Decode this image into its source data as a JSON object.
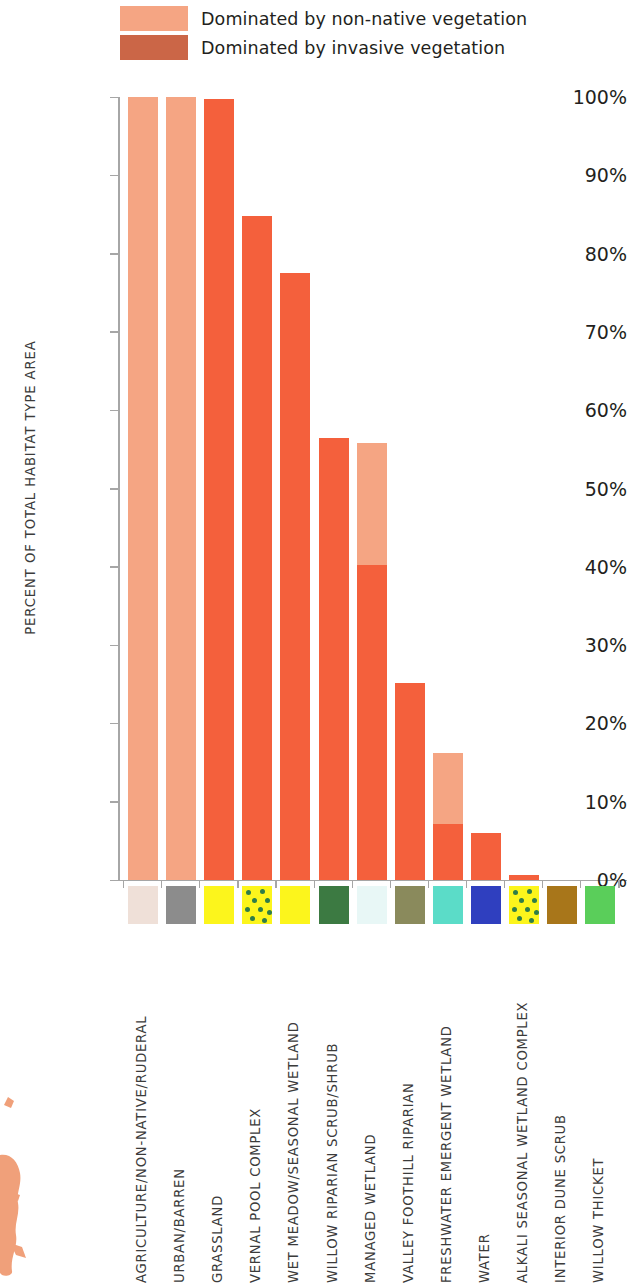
{
  "legend": {
    "items": [
      {
        "label": "Dominated by non-native vegetation",
        "color": "#f5a583",
        "key": "nonnative"
      },
      {
        "label": "Dominated by invasive vegetation",
        "color": "#cb6647",
        "key": "invasive"
      }
    ]
  },
  "axis": {
    "y_label": "PERCENT OF TOTAL HABITAT TYPE AREA",
    "y_ticks": [
      "0%",
      "10%",
      "20%",
      "30%",
      "40%",
      "50%",
      "60%",
      "70%",
      "80%",
      "90%",
      "100%"
    ]
  },
  "chart_data": {
    "type": "bar",
    "title": "",
    "xlabel": "",
    "ylabel": "PERCENT OF TOTAL HABITAT TYPE AREA",
    "ylim": [
      0,
      100
    ],
    "grid": false,
    "legend_position": "top",
    "stacked": true,
    "categories": [
      "AGRICULTURE/NON-NATIVE/RUDERAL",
      "URBAN/BARREN",
      "GRASSLAND",
      "VERNAL POOL COMPLEX",
      "WET MEADOW/SEASONAL WETLAND",
      "WILLOW RIPARIAN SCRUB/SHRUB",
      "MANAGED WETLAND",
      "VALLEY FOOTHILL RIPARIAN",
      "FRESHWATER EMERGENT WETLAND",
      "WATER",
      "ALKALI SEASONAL WETLAND COMPLEX",
      "INTERIOR DUNE SCRUB",
      "WILLOW THICKET"
    ],
    "series": [
      {
        "name": "Dominated by invasive vegetation",
        "color": "#f4603c",
        "values": [
          0,
          0,
          99.7,
          84.8,
          77.5,
          56.5,
          40.2,
          25.1,
          7.1,
          6.0,
          0.6,
          0,
          0
        ]
      },
      {
        "name": "Dominated by non-native vegetation",
        "color": "#f5a583",
        "values": [
          100,
          100,
          0,
          0,
          0,
          0,
          15.6,
          0,
          9.1,
          0,
          0,
          0,
          0
        ]
      }
    ],
    "totals": [
      100,
      100,
      99.7,
      84.8,
      77.5,
      56.5,
      55.8,
      25.1,
      16.2,
      6.0,
      0.6,
      0,
      0
    ],
    "habitat_swatches": [
      {
        "name": "AGRICULTURE/NON-NATIVE/RUDERAL",
        "color": "#efe0d8",
        "dots": false
      },
      {
        "name": "URBAN/BARREN",
        "color": "#8c8c8c",
        "dots": false
      },
      {
        "name": "GRASSLAND",
        "color": "#fcf51c",
        "dots": false
      },
      {
        "name": "VERNAL POOL COMPLEX",
        "color": "#fcf51c",
        "dots": true
      },
      {
        "name": "WET MEADOW/SEASONAL WETLAND",
        "color": "#fcf51c",
        "dots": false
      },
      {
        "name": "WILLOW RIPARIAN SCRUB/SHRUB",
        "color": "#3c7a42",
        "dots": false
      },
      {
        "name": "MANAGED WETLAND",
        "color": "#e8f7f6",
        "dots": false
      },
      {
        "name": "VALLEY FOOTHILL RIPARIAN",
        "color": "#8a8a5c",
        "dots": false
      },
      {
        "name": "FRESHWATER EMERGENT WETLAND",
        "color": "#5bdcc8",
        "dots": false
      },
      {
        "name": "WATER",
        "color": "#2f3fbf",
        "dots": false
      },
      {
        "name": "ALKALI SEASONAL WETLAND COMPLEX",
        "color": "#fcf51c",
        "dots": true
      },
      {
        "name": "INTERIOR DUNE SCRUB",
        "color": "#a8761a",
        "dots": false
      },
      {
        "name": "WILLOW THICKET",
        "color": "#5ace5a",
        "dots": false
      }
    ]
  },
  "map_fragment": {
    "color": "#f0a07a"
  }
}
